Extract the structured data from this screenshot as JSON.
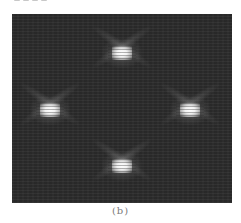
{
  "figure": {
    "caption": "(b)",
    "background_color": "#2b2b2b",
    "spot_color": "#ffffff",
    "spots": [
      {
        "name": "top",
        "x": 110,
        "y": 39
      },
      {
        "name": "left",
        "x": 38,
        "y": 96
      },
      {
        "name": "right",
        "x": 178,
        "y": 96
      },
      {
        "name": "bottom",
        "x": 110,
        "y": 152
      }
    ]
  }
}
